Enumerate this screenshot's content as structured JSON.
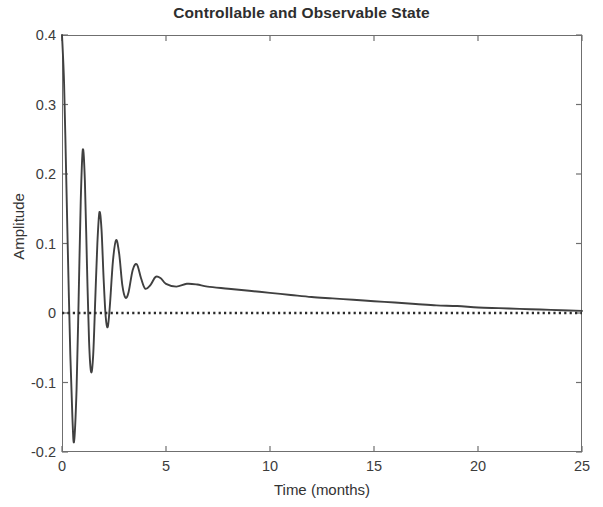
{
  "chart_data": {
    "type": "line",
    "title": "Controllable and Observable State",
    "xlabel": "Time (months)",
    "ylabel": "Amplitude",
    "xlim": [
      0,
      25
    ],
    "ylim": [
      -0.2,
      0.4
    ],
    "xticks": [
      "0",
      "5",
      "10",
      "15",
      "20",
      "25"
    ],
    "xtick_values": [
      0,
      5,
      10,
      15,
      20,
      25
    ],
    "yticks": [
      "0.4",
      "0.3",
      "0.2",
      "0.1",
      "0",
      "-0.1",
      "-0.2"
    ],
    "ytick_values": [
      0.4,
      0.3,
      0.2,
      0.1,
      0,
      -0.1,
      -0.2
    ],
    "grid": false,
    "legend": null,
    "series": [
      {
        "name": "state response",
        "style": "solid",
        "color": "#404040",
        "description": "Damped oscillatory impulse response starting at 0.4, ringing with period about 0.55 months and decaying to a slow positive tail that approaches zero by 25 months",
        "x": [
          0.0,
          0.1,
          0.2,
          0.28,
          0.4,
          0.5,
          0.58,
          0.7,
          0.8,
          0.9,
          1.0,
          1.1,
          1.2,
          1.3,
          1.4,
          1.5,
          1.6,
          1.7,
          1.8,
          1.9,
          2.0,
          2.1,
          2.2,
          2.3,
          2.45,
          2.6,
          2.75,
          2.9,
          3.05,
          3.2,
          3.4,
          3.6,
          3.8,
          4.0,
          4.25,
          4.5,
          4.75,
          5.0,
          5.5,
          6.0,
          6.5,
          7.0,
          8.0,
          9.0,
          10.0,
          11.0,
          12.0,
          13.0,
          14.0,
          15.0,
          16.0,
          17.0,
          18.0,
          19.0,
          20.0,
          21.0,
          22.0,
          23.0,
          24.0,
          25.0
        ],
        "y": [
          0.4,
          0.33,
          0.2,
          0.09,
          -0.06,
          -0.15,
          -0.185,
          -0.11,
          0.02,
          0.16,
          0.235,
          0.19,
          0.07,
          -0.04,
          -0.085,
          -0.06,
          0.02,
          0.1,
          0.145,
          0.12,
          0.05,
          -0.005,
          -0.02,
          0.01,
          0.075,
          0.105,
          0.085,
          0.04,
          0.022,
          0.03,
          0.062,
          0.07,
          0.05,
          0.035,
          0.04,
          0.052,
          0.05,
          0.042,
          0.038,
          0.042,
          0.041,
          0.038,
          0.035,
          0.032,
          0.029,
          0.026,
          0.023,
          0.021,
          0.019,
          0.017,
          0.015,
          0.013,
          0.011,
          0.01,
          0.008,
          0.007,
          0.006,
          0.005,
          0.004,
          0.003
        ]
      },
      {
        "name": "zero reference",
        "style": "dotted",
        "color": "#2b2b2b",
        "description": "Horizontal dotted reference line at amplitude 0",
        "x": [
          0,
          25
        ],
        "y": [
          0,
          0
        ]
      }
    ]
  }
}
